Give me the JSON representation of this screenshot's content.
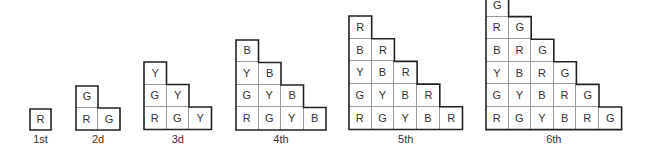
{
  "diagram": {
    "legend_letters": [
      "R",
      "G",
      "Y",
      "B"
    ],
    "stages": [
      {
        "label": "1st",
        "rows": [
          [
            "R"
          ]
        ]
      },
      {
        "label": "2d",
        "rows": [
          [
            "G"
          ],
          [
            "R",
            "G"
          ]
        ]
      },
      {
        "label": "3d",
        "rows": [
          [
            "Y"
          ],
          [
            "G",
            "Y"
          ],
          [
            "R",
            "G",
            "Y"
          ]
        ]
      },
      {
        "label": "4th",
        "rows": [
          [
            "B"
          ],
          [
            "Y",
            "B"
          ],
          [
            "G",
            "Y",
            "B"
          ],
          [
            "R",
            "G",
            "Y",
            "B"
          ]
        ]
      },
      {
        "label": "5th",
        "rows": [
          [
            "R"
          ],
          [
            "B",
            "R"
          ],
          [
            "Y",
            "B",
            "R"
          ],
          [
            "G",
            "Y",
            "B",
            "R"
          ],
          [
            "R",
            "G",
            "Y",
            "B",
            "R"
          ]
        ]
      },
      {
        "label": "6th",
        "rows": [
          [
            "G"
          ],
          [
            "R",
            "G"
          ],
          [
            "B",
            "R",
            "G"
          ],
          [
            "Y",
            "B",
            "R",
            "G"
          ],
          [
            "G",
            "Y",
            "B",
            "R",
            "G"
          ],
          [
            "R",
            "G",
            "Y",
            "B",
            "R",
            "G"
          ]
        ]
      }
    ]
  },
  "layout": {
    "stage_left": [
      30,
      76,
      144,
      236,
      349,
      486
    ],
    "stage_cell": [
      21,
      22,
      22.5,
      22.5,
      22.7,
      22.6
    ],
    "bottom": 129.5,
    "label_y": 133
  }
}
